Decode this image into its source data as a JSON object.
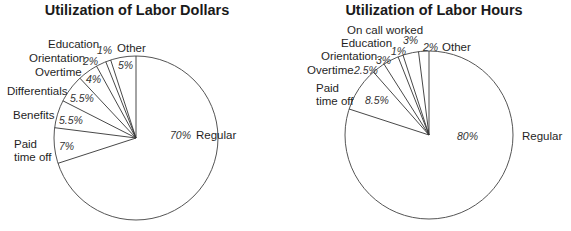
{
  "chart_data": [
    {
      "type": "pie",
      "title": "Utilization of Labor Dollars",
      "categories": [
        "Regular",
        "Paid time off",
        "Benefits",
        "Differentials",
        "Overtime",
        "Orientation",
        "Education",
        "Other"
      ],
      "values": [
        70,
        7,
        5.5,
        5.5,
        4,
        2,
        1,
        5
      ],
      "value_labels": [
        "70%",
        "7%",
        "5.5%",
        "5.5%",
        "4%",
        "2%",
        "1%",
        "5%"
      ],
      "unit": "%",
      "legend": "none (direct labels)"
    },
    {
      "type": "pie",
      "title": "Utilization of Labor Hours",
      "categories": [
        "Regular",
        "Paid time off",
        "Overtime",
        "Orientation",
        "Education",
        "On call worked",
        "Other"
      ],
      "values": [
        80,
        8.5,
        2.5,
        3,
        1,
        3,
        2
      ],
      "value_labels": [
        "80%",
        "8.5%",
        "2.5%",
        "3%",
        "1%",
        "3%",
        "2%"
      ],
      "unit": "%",
      "legend": "none (direct labels)"
    }
  ],
  "charts": [
    {
      "title": "Utilization of Labor Dollars",
      "cx": 136,
      "cy": 138,
      "r": 82,
      "main": {
        "name": "Regular",
        "pct": "70%",
        "value": 70,
        "label_xy": [
          196,
          139
        ],
        "pct_xy": [
          170,
          139
        ]
      },
      "slices_ccw_from_top": [
        {
          "name": "Other",
          "value": 5,
          "pct": "5%",
          "name_lines": [
            "Other"
          ],
          "name_xy": [
            117,
            52
          ],
          "pct_xy": [
            118,
            69
          ]
        },
        {
          "name": "Education",
          "value": 1,
          "pct": "1%",
          "name_lines": [
            "Education"
          ],
          "name_xy": [
            48,
            48
          ],
          "pct_xy": [
            97,
            54
          ]
        },
        {
          "name": "Orientation",
          "value": 2,
          "pct": "2%",
          "name_lines": [
            "Orientation"
          ],
          "name_xy": [
            29,
            62
          ],
          "pct_xy": [
            83,
            65
          ]
        },
        {
          "name": "Overtime",
          "value": 4,
          "pct": "4%",
          "name_lines": [
            "Overtime"
          ],
          "name_xy": [
            35,
            76
          ],
          "pct_xy": [
            86,
            83
          ]
        },
        {
          "name": "Differentials",
          "value": 5.5,
          "pct": "5.5%",
          "name_lines": [
            "Differentials"
          ],
          "name_xy": [
            7,
            95
          ],
          "pct_xy": [
            70,
            102
          ]
        },
        {
          "name": "Benefits",
          "value": 5.5,
          "pct": "5.5%",
          "name_lines": [
            "Benefits"
          ],
          "name_xy": [
            13,
            119
          ],
          "pct_xy": [
            59,
            124
          ]
        },
        {
          "name": "Paid time off",
          "value": 7,
          "pct": "7%",
          "name_lines": [
            "Paid",
            "time off"
          ],
          "name_xy": [
            14,
            148
          ],
          "pct_xy": [
            59,
            150
          ]
        }
      ]
    },
    {
      "title": "Utilization of Labor Hours",
      "cx": 429,
      "cy": 135,
      "r": 84,
      "main": {
        "name": "Regular",
        "pct": "80%",
        "value": 80,
        "label_xy": [
          522,
          140
        ],
        "pct_xy": [
          457,
          140
        ]
      },
      "slices_ccw_from_top": [
        {
          "name": "Other",
          "value": 2,
          "pct": "2%",
          "name_lines": [
            "Other"
          ],
          "name_xy": [
            442,
            51
          ],
          "pct_xy": [
            423,
            51
          ]
        },
        {
          "name": "On call worked",
          "value": 3,
          "pct": "3%",
          "name_lines": [
            "On call worked"
          ],
          "name_xy": [
            347,
            34
          ],
          "pct_xy": [
            403,
            44
          ]
        },
        {
          "name": "Education",
          "value": 1,
          "pct": "1%",
          "name_lines": [
            "Education"
          ],
          "name_xy": [
            341,
            47
          ],
          "pct_xy": [
            391,
            55
          ]
        },
        {
          "name": "Orientation",
          "value": 3,
          "pct": "3%",
          "name_lines": [
            "Orientation"
          ],
          "name_xy": [
            321,
            60
          ],
          "pct_xy": [
            376,
            64
          ]
        },
        {
          "name": "Overtime",
          "value": 2.5,
          "pct": "2.5%",
          "name_lines": [
            "Overtime"
          ],
          "name_xy": [
            307,
            74
          ],
          "pct_xy": [
            354,
            74
          ]
        },
        {
          "name": "Paid time off",
          "value": 8.5,
          "pct": "8.5%",
          "name_lines": [
            "Paid",
            "time off"
          ],
          "name_xy": [
            316,
            92
          ],
          "pct_xy": [
            365,
            104
          ]
        }
      ]
    }
  ]
}
